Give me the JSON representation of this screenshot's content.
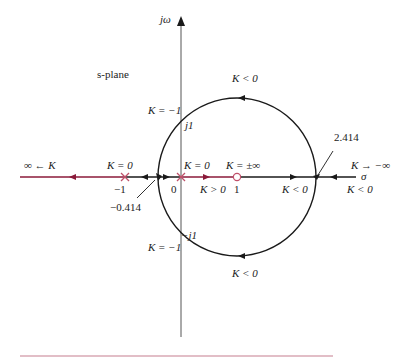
{
  "diagram": {
    "type": "root-locus",
    "plane_label": "s-plane",
    "axes": {
      "imag_label": "jω",
      "real_label": "σ"
    },
    "colors": {
      "positive_K_locus": "#8b1a3a",
      "negative_K_locus": "#1a1a1a",
      "axis": "#555555",
      "pole_marker": "#c0506a",
      "zero_marker": "#c0506a",
      "bottom_rule": "#d8a8b4"
    },
    "labels": {
      "inf_minus_K": "∞ ← K",
      "k0_left": "K = 0",
      "k0_origin": "K = 0",
      "k_pm_inf": "K = ±∞",
      "k_to_minus_inf": "K → −∞",
      "k_minus1_top": "K = −1",
      "k_minus1_bottom": "K = −1",
      "k_lt0_top": "K < 0",
      "k_lt0_bottom": "K < 0",
      "k_lt0_axis_mid": "K < 0",
      "k_lt0_axis_right": "K < 0",
      "k_gt0": "K > 0",
      "tick_minus1": "−1",
      "tick_0": "0",
      "tick_1": "1",
      "j1": "j1",
      "minus_j1": "−j1",
      "breakaway_left": "−0.414",
      "breakaway_right": "2.414"
    },
    "poles": [
      -1,
      0
    ],
    "zeros": [
      1
    ],
    "breakaway_points": [
      -0.414,
      2.414
    ],
    "imag_axis_crossings": [
      "j1",
      "-j1"
    ]
  }
}
